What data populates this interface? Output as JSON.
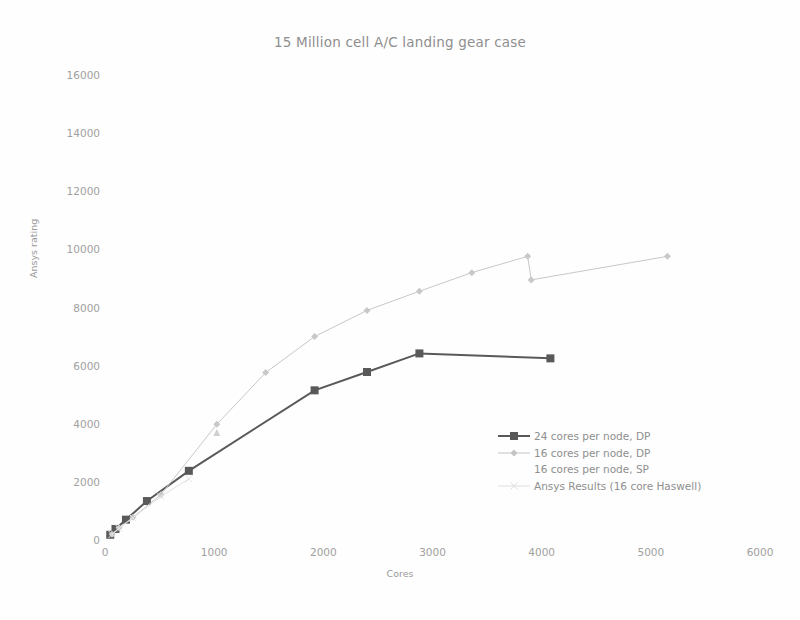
{
  "chart_data": {
    "type": "line",
    "title": "15 Million cell A/C landing gear case",
    "xlabel": "Cores",
    "ylabel": "Ansys rating",
    "xlim": [
      0,
      6000
    ],
    "ylim": [
      0,
      16000
    ],
    "xticks": [
      0,
      1000,
      2000,
      3000,
      4000,
      5000,
      6000
    ],
    "yticks": [
      0,
      2000,
      4000,
      6000,
      8000,
      10000,
      12000,
      14000,
      16000
    ],
    "grid": false,
    "legend_position": "center-right",
    "series": [
      {
        "name": "24 cores per node, DP",
        "color": "#595959",
        "marker": "square",
        "x": [
          48,
          96,
          192,
          384,
          768,
          1920,
          2400,
          2880,
          4080
        ],
        "y": [
          180,
          380,
          700,
          1340,
          2380,
          5150,
          5780,
          6420,
          6250
        ]
      },
      {
        "name": "16 cores per node, DP",
        "color": "#c8c8c8",
        "marker": "diamond",
        "x": [
          64,
          128,
          256,
          512,
          1024,
          1472,
          1920,
          2400,
          2880,
          3360,
          3872,
          3904,
          5152
        ],
        "y": [
          200,
          420,
          780,
          1560,
          3980,
          5760,
          7000,
          7900,
          8560,
          9200,
          9760,
          8950,
          9760
        ]
      },
      {
        "name": "16 cores per node, SP",
        "color": "#d0d0d0",
        "marker": "triangle",
        "x": [
          1024
        ],
        "y": [
          3700
        ]
      },
      {
        "name": "Ansys Results (16 core Haswell)",
        "color": "#e2e2e2",
        "marker": "cross",
        "x": [
          64,
          128,
          256,
          512,
          768
        ],
        "y": [
          190,
          400,
          760,
          1500,
          2100
        ]
      }
    ]
  },
  "legend": {
    "items": [
      {
        "label": "24 cores per node, DP",
        "marker": "square",
        "color": "#585858"
      },
      {
        "label": "16 cores per node, DP",
        "marker": "diamond",
        "color": "#c4c4c4"
      },
      {
        "label": "16 cores per node, SP",
        "marker": "none",
        "color": "#d6d6d6"
      },
      {
        "label": "Ansys Results (16 core Haswell)",
        "marker": "cross",
        "color": "#dedede"
      }
    ]
  }
}
